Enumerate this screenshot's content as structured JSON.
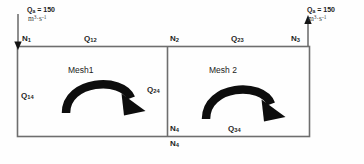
{
  "diagram": {
    "line_color": "#6b6b6b",
    "arrow_color": "#0d0d0d",
    "text_color": "#1c1c1c"
  },
  "meshes": [
    {
      "id": "mesh1",
      "label": "Mesh1",
      "loop_direction": "clockwise"
    },
    {
      "id": "mesh2",
      "label": "Mesh 2",
      "loop_direction": "clockwise"
    }
  ],
  "nodes": [
    {
      "id": "n1",
      "label": "N",
      "subscript": "1",
      "position": "top-left"
    },
    {
      "id": "n2",
      "label": "N",
      "subscript": "2",
      "position": "top-middle"
    },
    {
      "id": "n3",
      "label": "N",
      "subscript": "3",
      "position": "top-right"
    },
    {
      "id": "n4_inner",
      "label": "N",
      "subscript": "4",
      "position": "bottom-middle-inside"
    },
    {
      "id": "n4_outer",
      "label": "N",
      "subscript": "4",
      "position": "bottom-middle-below"
    }
  ],
  "pipes": [
    {
      "id": "q12",
      "label": "Q",
      "subscript": "12",
      "edge": "top-left"
    },
    {
      "id": "q23",
      "label": "Q",
      "subscript": "23",
      "edge": "top-right"
    },
    {
      "id": "q14",
      "label": "Q",
      "subscript": "14",
      "edge": "left"
    },
    {
      "id": "q24",
      "label": "Q",
      "subscript": "24",
      "edge": "middle-divider"
    },
    {
      "id": "q34",
      "label": "Q",
      "subscript": "34",
      "edge": "bottom-right"
    }
  ],
  "external_flows": [
    {
      "id": "inflow_n1",
      "symbol": "Q",
      "subscript": "a",
      "equals": "= 150",
      "units_base": "m",
      "units_exp1": "3",
      "units_mid": "·s",
      "units_exp2": "-1",
      "direction": "down",
      "attached_node": "N1"
    },
    {
      "id": "outflow_n3",
      "symbol": "Q",
      "subscript": "a",
      "equals": "= 150",
      "units_base": "m",
      "units_exp1": "3",
      "units_mid": "·s",
      "units_exp2": "-1",
      "direction": "up",
      "attached_node": "N3"
    }
  ]
}
